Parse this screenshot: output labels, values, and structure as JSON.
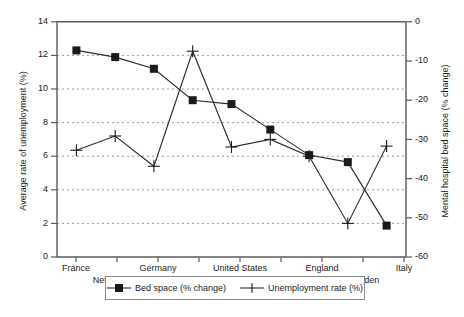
{
  "chart_data": {
    "type": "line",
    "title": "",
    "categories": [
      "France",
      "Netherlands",
      "Germany",
      "Ireland",
      "United States",
      "Denmark",
      "England",
      "Sweden",
      "Italy"
    ],
    "series": [
      {
        "name": "Bed space (% change)",
        "axis": "right",
        "marker": "filled-square",
        "values": [
          -7.3,
          -9.0,
          -12.0,
          -20.0,
          -21.0,
          -27.5,
          -34.0,
          -35.8,
          -52.0
        ]
      },
      {
        "name": "Unemployment rate (%)",
        "axis": "left",
        "marker": "plus",
        "values": [
          6.35,
          7.2,
          5.4,
          12.25,
          6.55,
          7.0,
          6.0,
          2.0,
          6.6
        ]
      }
    ],
    "xlabel": "",
    "ylabel": "Average rate of unemployment (%)",
    "ylabel_right": "Mental hospital bed space (% change)",
    "ylim": [
      0,
      14
    ],
    "yticks": [
      0,
      2,
      4,
      6,
      8,
      10,
      12,
      14
    ],
    "ylim_right": [
      -60,
      0
    ],
    "yticks_right": [
      0,
      -10,
      -20,
      -30,
      -40,
      -50,
      -60
    ],
    "grid": true,
    "legend_position": "bottom"
  },
  "axes": {
    "left_title": "Average rate of unemployment (%)",
    "right_title": "Mental hospital bed space (% change)",
    "left_ticks": [
      "14",
      "12",
      "10",
      "8",
      "6",
      "4",
      "2",
      "0"
    ],
    "right_ticks": [
      "0",
      "-10",
      "-20",
      "-30",
      "-40",
      "-50",
      "-60"
    ],
    "x_ticks": [
      "France",
      "Netherlands",
      "Germany",
      "Ireland",
      "United States",
      "Denmark",
      "England",
      "Sweden",
      "Italy"
    ]
  },
  "legend": {
    "entries": [
      {
        "label": "Bed space (% change)",
        "marker": "filled-square"
      },
      {
        "label": "Unemployment rate (%)",
        "marker": "plus"
      }
    ]
  },
  "colors": {
    "axis": "#5a5a5a",
    "grid": "#9a9a9a",
    "series_line": "#2b2b2b",
    "background": "#ffffff"
  }
}
